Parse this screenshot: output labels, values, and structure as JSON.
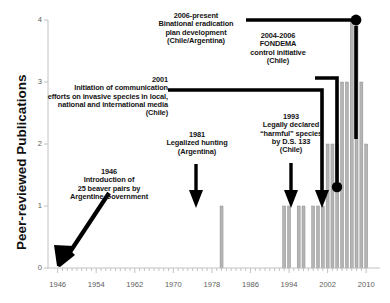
{
  "chart_data": {
    "type": "bar",
    "title": "",
    "xlabel": "",
    "ylabel": "Peer-reviewed Publications",
    "xlim": [
      1944,
      2011
    ],
    "ylim": [
      0,
      4
    ],
    "grid": false,
    "legend": "none",
    "xticks": [
      1946,
      1954,
      1962,
      1970,
      1978,
      1986,
      1994,
      2002,
      2010
    ],
    "yticks": [
      0,
      1,
      2,
      3,
      4
    ],
    "bar_color": "#b4b4b4",
    "axis_color": "#bfbfbf",
    "annotation_color": "#000000",
    "x": [
      1980,
      1993,
      1994,
      1996,
      1997,
      1999,
      2000,
      2001,
      2002,
      2003,
      2004,
      2005,
      2006,
      2007,
      2008,
      2009,
      2010
    ],
    "values": [
      1,
      1,
      1,
      1,
      1,
      1,
      1,
      1,
      2,
      2,
      2,
      3,
      3,
      4,
      4,
      3,
      2
    ],
    "categories": [
      "1980",
      "1993",
      "1994",
      "1996",
      "1997",
      "1999",
      "2000",
      "2001",
      "2002",
      "2003",
      "2004",
      "2005",
      "2006",
      "2007",
      "2008",
      "2009",
      "2010"
    ],
    "annotations": [
      {
        "id": "1946",
        "year_label": "1946",
        "text": "1946\nIntroduction of\n25 beaver pairs by\nArgentine Government",
        "points_to_year": 1946,
        "points_to_value": 0,
        "leader": "diagonal-arrow"
      },
      {
        "id": "1981",
        "year_label": "1981",
        "text": "1981\nLegalized hunting\n(Argentina)",
        "points_to_year": 1980,
        "points_to_value": 1,
        "leader": "down-arrow"
      },
      {
        "id": "1993",
        "year_label": "1993",
        "text": "1993\nLegally declared\n“harmful” species\nby D.S. 133\n(Chile)",
        "points_to_year": 1993,
        "points_to_value": 1,
        "leader": "down-arrow"
      },
      {
        "id": "2001",
        "year_label": "2001",
        "text": "2001\nInitiation of communication\nefforts on invasive species in local,\nnational and international media\n(Chile)",
        "points_to_year": 2001,
        "points_to_value": 1,
        "leader": "elbow-down-arrow"
      },
      {
        "id": "2004-2006",
        "year_label": "2004-2006",
        "text": "2004-2006\nFONDEMA\ncontrol initiative\n(Chile)",
        "points_to_year": 2004,
        "points_to_value": 1,
        "leader": "elbow-down-dot"
      },
      {
        "id": "2006-present",
        "year_label": "2006-present",
        "text": "2006-present\nBinational eradication\nplan development\n(Chile/Argentina)",
        "points_to_year": 2007,
        "points_to_value": 4,
        "leader": "line-dot"
      }
    ]
  },
  "axis": {
    "y_title": "Peer-reviewed Publications",
    "x_tick_labels": [
      "1946",
      "1954",
      "1962",
      "1970",
      "1978",
      "1986",
      "1994",
      "2002",
      "2010"
    ],
    "y_tick_labels": [
      "0",
      "1",
      "2",
      "3",
      "4"
    ]
  },
  "annotations_text": {
    "a1946": "1946\nIntroduction of\n25 beaver pairs by\nArgentine Government",
    "a1981": "1981\nLegalized hunting\n(Argentina)",
    "a1993": "1993\nLegally declared\n“harmful” species\nby D.S. 133\n(Chile)",
    "a2001": "2001\nInitiation of communication\nefforts on invasive species in local,\nnational and international media\n(Chile)",
    "a2004": "2004-2006\nFONDEMA\ncontrol initiative\n(Chile)",
    "a2006": "2006-present\nBinational eradication\nplan development\n(Chile/Argentina)"
  }
}
